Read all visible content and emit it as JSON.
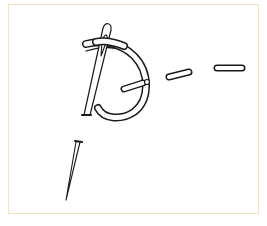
{
  "illustration": {
    "subject": "embroidery-stitch-with-needle",
    "caption": "",
    "colors": {
      "border": "#efe3c0",
      "line": "#1a1a1a",
      "background": "#ffffff"
    },
    "elements": [
      {
        "name": "needle-upper",
        "description": "needle threaded through fabric, eye at top"
      },
      {
        "name": "thread-loop",
        "description": "curved thread loop forming D shape"
      },
      {
        "name": "stitch-1",
        "description": "short stitch segment inside loop"
      },
      {
        "name": "stitch-2",
        "description": "dashed stitch segment"
      },
      {
        "name": "stitch-3",
        "description": "dashed stitch segment"
      },
      {
        "name": "needle-lower",
        "description": "needle point emerging below"
      }
    ]
  }
}
